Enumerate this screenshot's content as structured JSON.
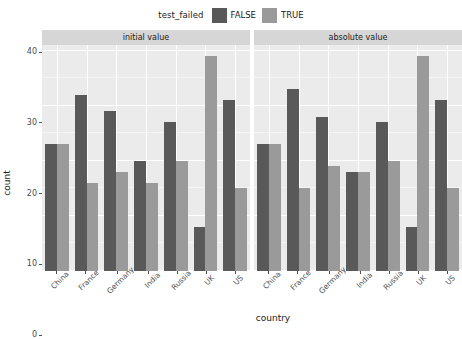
{
  "legend": {
    "title": "test_failed",
    "items": [
      {
        "label": "FALSE",
        "color": "#595959"
      },
      {
        "label": "TRUE",
        "color": "#9a9a9a"
      }
    ]
  },
  "axes": {
    "ylabel": "count",
    "xlabel": "country",
    "yticks": [
      "0",
      "10",
      "20",
      "30",
      "40"
    ]
  },
  "chart_data": {
    "type": "bar",
    "title": "",
    "xlabel": "country",
    "ylabel": "count",
    "ylim": [
      0,
      41
    ],
    "yticks": [
      0,
      10,
      20,
      30,
      40
    ],
    "grid": true,
    "legend_position": "top",
    "legend_title": "test_failed",
    "categories": [
      "China",
      "France",
      "Germany",
      "India",
      "Russia",
      "UK",
      "US"
    ],
    "facets": [
      {
        "label": "initial value",
        "series": [
          {
            "name": "FALSE",
            "color": "#595959",
            "values": [
              23,
              32,
              29,
              20,
              27,
              8,
              31
            ]
          },
          {
            "name": "TRUE",
            "color": "#9a9a9a",
            "values": [
              23,
              16,
              18,
              16,
              20,
              39,
              15
            ]
          }
        ]
      },
      {
        "label": "absolute value",
        "series": [
          {
            "name": "FALSE",
            "color": "#595959",
            "values": [
              23,
              33,
              28,
              18,
              27,
              8,
              31
            ]
          },
          {
            "name": "TRUE",
            "color": "#9a9a9a",
            "values": [
              23,
              15,
              19,
              18,
              20,
              39,
              15
            ]
          }
        ]
      }
    ]
  },
  "theme": {
    "panel_bg": "#ebebeb",
    "grid_color": "#ffffff",
    "strip_bg": "#d6d6d6",
    "text_color": "#1a1a1a",
    "axis_text_color": "#4d4d4d"
  }
}
